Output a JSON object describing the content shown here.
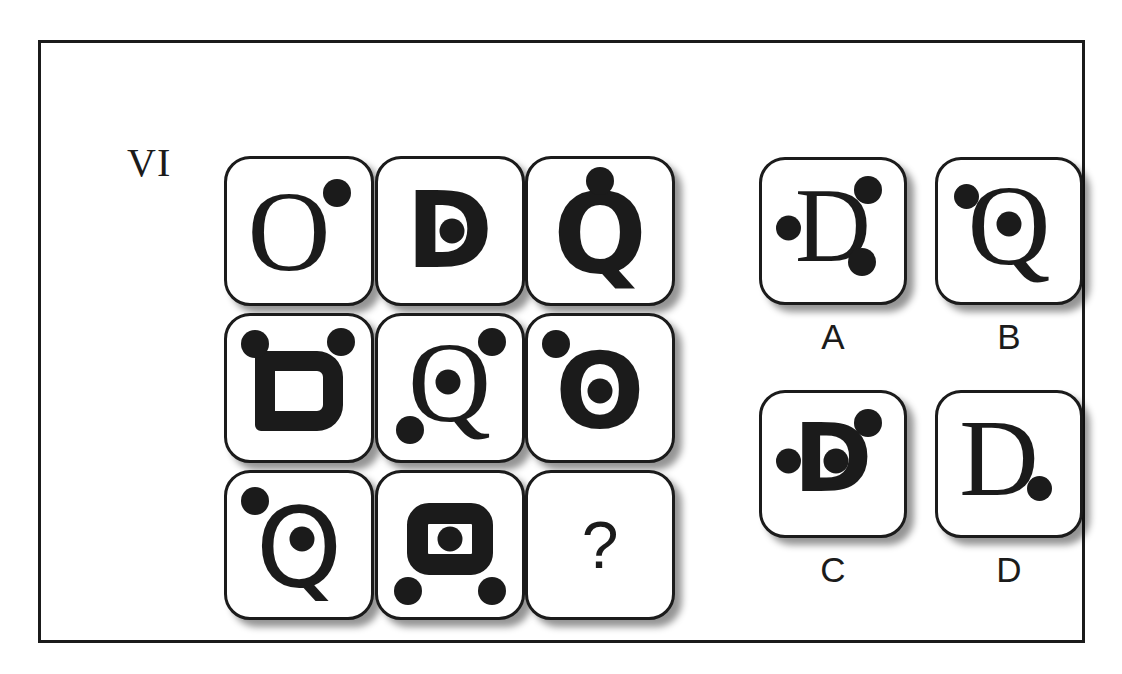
{
  "puzzle": {
    "index_label": "VI",
    "missing_marker": "?",
    "frame_color": "#1b1b1b",
    "ink_color": "#1b1b1b",
    "background_color": "#ffffff"
  },
  "matrix": {
    "rows": 3,
    "columns": 3,
    "cells": [
      {
        "id": "r1c1",
        "letter": "O",
        "style": "serif",
        "dots": [
          "top-right"
        ]
      },
      {
        "id": "r1c2",
        "letter": "D",
        "style": "sans-bold",
        "dots": [
          "inside"
        ]
      },
      {
        "id": "r1c3",
        "letter": "Q",
        "style": "sans-bold",
        "dots": [
          "top-center"
        ]
      },
      {
        "id": "r2c1",
        "letter": "D",
        "style": "sans-bold",
        "dots": [
          "top-left",
          "top-right"
        ]
      },
      {
        "id": "r2c2",
        "letter": "Q",
        "style": "serif",
        "dots": [
          "inside",
          "top-right",
          "bottom-left"
        ]
      },
      {
        "id": "r2c3",
        "letter": "O",
        "style": "sans-bold",
        "dots": [
          "inside",
          "top-left"
        ]
      },
      {
        "id": "r3c1",
        "letter": "Q",
        "style": "sans-bold",
        "dots": [
          "inside",
          "top-left"
        ]
      },
      {
        "id": "r3c2",
        "letter": "O",
        "style": "sans-bold",
        "dots": [
          "inside",
          "bottom-left",
          "bottom-right"
        ]
      },
      {
        "id": "r3c3",
        "letter": "?",
        "style": "sans",
        "dots": []
      }
    ]
  },
  "answers": {
    "options": [
      {
        "key": "A",
        "letter": "D",
        "style": "serif",
        "dots": [
          "left",
          "top-right",
          "bottom-right"
        ]
      },
      {
        "key": "B",
        "letter": "Q",
        "style": "serif",
        "dots": [
          "inside",
          "top-left"
        ]
      },
      {
        "key": "C",
        "letter": "D",
        "style": "sans-bold",
        "dots": [
          "inside",
          "left",
          "top-right"
        ]
      },
      {
        "key": "D",
        "letter": "D",
        "style": "serif",
        "dots": [
          "bottom-right"
        ]
      }
    ]
  }
}
